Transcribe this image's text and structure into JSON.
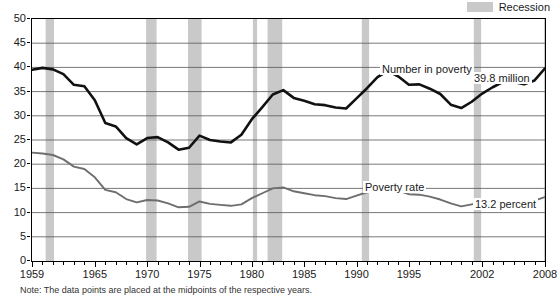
{
  "legend": {
    "label": "Recession",
    "swatch_color": "#c9c9c9"
  },
  "title": "Number in poverty and poverty rate",
  "note": "Note: The data points are placed at the midpoints of the respective years.",
  "annotations": [
    {
      "name": "number-in-poverty-label",
      "text": "Number in poverty",
      "x": 380,
      "y": 63
    },
    {
      "name": "number-in-poverty-value",
      "text": "39.8 million",
      "x": 472,
      "y": 72
    },
    {
      "name": "poverty-rate-label",
      "text": "Poverty rate",
      "x": 363,
      "y": 181
    },
    {
      "name": "poverty-rate-value",
      "text": "13.2 percent",
      "x": 473,
      "y": 198
    }
  ],
  "colors": {
    "number_line": "#111111",
    "rate_line": "#6e6e6e",
    "recession_band": "#c9c9c9",
    "grid": "#555555",
    "axis": "#000000"
  },
  "chart_data": {
    "type": "line",
    "title": "Number in poverty and poverty rate",
    "xlabel": "",
    "ylabel": "",
    "xlim": [
      1959,
      2008
    ],
    "ylim": [
      0,
      50
    ],
    "ytick_step": 5,
    "yticks": [
      0,
      5,
      10,
      15,
      20,
      25,
      30,
      35,
      40,
      45,
      50
    ],
    "xticks_labeled": [
      1959,
      1965,
      1970,
      1975,
      1980,
      1985,
      1990,
      1995,
      2002,
      2008
    ],
    "xticks_minor_every": 1,
    "grid": "horizontal",
    "legend_position": "top-right",
    "x": [
      1959,
      1960,
      1961,
      1962,
      1963,
      1964,
      1965,
      1966,
      1967,
      1968,
      1969,
      1970,
      1971,
      1972,
      1973,
      1974,
      1975,
      1976,
      1977,
      1978,
      1979,
      1980,
      1981,
      1982,
      1983,
      1984,
      1985,
      1986,
      1987,
      1988,
      1989,
      1990,
      1991,
      1992,
      1993,
      1994,
      1995,
      1996,
      1997,
      1998,
      1999,
      2000,
      2001,
      2002,
      2003,
      2004,
      2005,
      2006,
      2007,
      2008
    ],
    "series": [
      {
        "name": "Number in poverty",
        "unit": "millions",
        "color": "#111111",
        "end_label": "39.8 million",
        "values": [
          39.5,
          39.9,
          39.6,
          38.6,
          36.4,
          36.1,
          33.2,
          28.5,
          27.8,
          25.4,
          24.1,
          25.4,
          25.6,
          24.5,
          23.0,
          23.4,
          25.9,
          25.0,
          24.7,
          24.5,
          26.1,
          29.3,
          31.8,
          34.4,
          35.3,
          33.7,
          33.1,
          32.4,
          32.2,
          31.7,
          31.5,
          33.6,
          35.7,
          38.0,
          39.3,
          38.1,
          36.4,
          36.5,
          35.6,
          34.5,
          32.3,
          31.6,
          32.9,
          34.6,
          35.9,
          37.0,
          37.0,
          36.5,
          37.3,
          39.8
        ]
      },
      {
        "name": "Poverty rate",
        "unit": "percent",
        "color": "#6e6e6e",
        "end_label": "13.2 percent",
        "values": [
          22.4,
          22.2,
          21.9,
          21.0,
          19.5,
          19.0,
          17.3,
          14.7,
          14.2,
          12.8,
          12.1,
          12.6,
          12.5,
          11.9,
          11.1,
          11.2,
          12.3,
          11.8,
          11.6,
          11.4,
          11.7,
          13.0,
          14.0,
          15.0,
          15.2,
          14.4,
          14.0,
          13.6,
          13.4,
          13.0,
          12.8,
          13.5,
          14.2,
          14.8,
          15.1,
          14.5,
          13.8,
          13.7,
          13.3,
          12.7,
          11.9,
          11.3,
          11.7,
          12.1,
          12.5,
          12.7,
          12.6,
          12.3,
          12.5,
          13.2
        ]
      }
    ],
    "recessions": [
      {
        "start": 1960.3,
        "end": 1961.1
      },
      {
        "start": 1969.9,
        "end": 1970.9
      },
      {
        "start": 1973.9,
        "end": 1975.2
      },
      {
        "start": 1980.1,
        "end": 1980.5
      },
      {
        "start": 1981.5,
        "end": 1982.9
      },
      {
        "start": 1990.5,
        "end": 1991.2
      },
      {
        "start": 2001.2,
        "end": 2001.9
      },
      {
        "start": 2007.9,
        "end": 2008.6
      }
    ]
  }
}
